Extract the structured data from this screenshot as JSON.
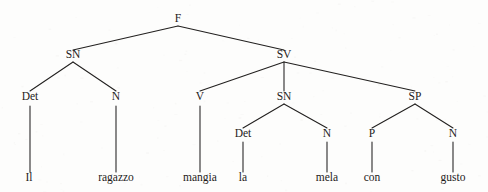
{
  "figure": {
    "kind": "constituency-syntax-tree",
    "sentence": "Il ragazzo mangia la mela con gusto",
    "language_note": "Italian",
    "background_color": "#fdfdfc",
    "ink_color": "#22201f"
  },
  "chart_data": {
    "type": "diagram",
    "title": "",
    "nodes": [
      {
        "id": "F",
        "label": "F",
        "x": 178,
        "y": 22,
        "level": 0,
        "kind": "nonterminal"
      },
      {
        "id": "SN1",
        "label": "SN",
        "x": 73,
        "y": 58,
        "level": 1,
        "kind": "nonterminal"
      },
      {
        "id": "SV",
        "label": "SV",
        "x": 284,
        "y": 58,
        "level": 1,
        "kind": "nonterminal"
      },
      {
        "id": "Det1",
        "label": "Det",
        "x": 30,
        "y": 100,
        "level": 2,
        "kind": "nonterminal"
      },
      {
        "id": "N1",
        "label": "N",
        "x": 116,
        "y": 100,
        "level": 2,
        "kind": "nonterminal"
      },
      {
        "id": "V",
        "label": "V",
        "x": 200,
        "y": 100,
        "level": 2,
        "kind": "nonterminal"
      },
      {
        "id": "SN2",
        "label": "SN",
        "x": 284,
        "y": 100,
        "level": 2,
        "kind": "nonterminal"
      },
      {
        "id": "SP",
        "label": "SP",
        "x": 415,
        "y": 100,
        "level": 2,
        "kind": "nonterminal"
      },
      {
        "id": "Det2",
        "label": "Det",
        "x": 243,
        "y": 137,
        "level": 3,
        "kind": "nonterminal"
      },
      {
        "id": "N2",
        "label": "N",
        "x": 327,
        "y": 137,
        "level": 3,
        "kind": "nonterminal"
      },
      {
        "id": "P",
        "label": "P",
        "x": 372,
        "y": 137,
        "level": 3,
        "kind": "nonterminal"
      },
      {
        "id": "N3",
        "label": "N",
        "x": 453,
        "y": 137,
        "level": 3,
        "kind": "nonterminal"
      },
      {
        "id": "w_il",
        "label": "Il",
        "x": 29,
        "y": 181,
        "level": 4,
        "kind": "terminal"
      },
      {
        "id": "w_rag",
        "label": "ragazzo",
        "x": 116,
        "y": 181,
        "level": 4,
        "kind": "terminal"
      },
      {
        "id": "w_man",
        "label": "mangia",
        "x": 200,
        "y": 181,
        "level": 4,
        "kind": "terminal"
      },
      {
        "id": "w_la",
        "label": "la",
        "x": 243,
        "y": 181,
        "level": 4,
        "kind": "terminal"
      },
      {
        "id": "w_mel",
        "label": "mela",
        "x": 327,
        "y": 181,
        "level": 4,
        "kind": "terminal"
      },
      {
        "id": "w_con",
        "label": "con",
        "x": 372,
        "y": 181,
        "level": 4,
        "kind": "terminal"
      },
      {
        "id": "w_gus",
        "label": "gusto",
        "x": 453,
        "y": 181,
        "level": 4,
        "kind": "terminal"
      }
    ],
    "edges": [
      {
        "from": "F",
        "to": "SN1",
        "x1": 178,
        "y1": 26,
        "x2": 73,
        "y2": 50,
        "style": "diagonal"
      },
      {
        "from": "F",
        "to": "SV",
        "x1": 178,
        "y1": 26,
        "x2": 284,
        "y2": 50,
        "style": "diagonal"
      },
      {
        "from": "SN1",
        "to": "Det1",
        "x1": 73,
        "y1": 62,
        "x2": 30,
        "y2": 91,
        "style": "diagonal"
      },
      {
        "from": "SN1",
        "to": "N1",
        "x1": 73,
        "y1": 62,
        "x2": 116,
        "y2": 91,
        "style": "diagonal"
      },
      {
        "from": "SV",
        "to": "V",
        "x1": 284,
        "y1": 62,
        "x2": 200,
        "y2": 91,
        "style": "diagonal"
      },
      {
        "from": "SV",
        "to": "SN2",
        "x1": 284,
        "y1": 62,
        "x2": 284,
        "y2": 91,
        "style": "vertical"
      },
      {
        "from": "SV",
        "to": "SP",
        "x1": 284,
        "y1": 62,
        "x2": 415,
        "y2": 91,
        "style": "diagonal"
      },
      {
        "from": "SN2",
        "to": "Det2",
        "x1": 284,
        "y1": 104,
        "x2": 243,
        "y2": 128,
        "style": "diagonal"
      },
      {
        "from": "SN2",
        "to": "N2",
        "x1": 284,
        "y1": 104,
        "x2": 327,
        "y2": 128,
        "style": "diagonal"
      },
      {
        "from": "SP",
        "to": "P",
        "x1": 415,
        "y1": 104,
        "x2": 372,
        "y2": 128,
        "style": "diagonal"
      },
      {
        "from": "SP",
        "to": "N3",
        "x1": 415,
        "y1": 104,
        "x2": 453,
        "y2": 128,
        "style": "diagonal"
      },
      {
        "from": "Det1",
        "to": "w_il",
        "x1": 30,
        "y1": 106,
        "x2": 30,
        "y2": 172,
        "style": "vertical"
      },
      {
        "from": "N1",
        "to": "w_rag",
        "x1": 116,
        "y1": 106,
        "x2": 116,
        "y2": 172,
        "style": "vertical"
      },
      {
        "from": "V",
        "to": "w_man",
        "x1": 200,
        "y1": 106,
        "x2": 200,
        "y2": 172,
        "style": "vertical"
      },
      {
        "from": "Det2",
        "to": "w_la",
        "x1": 243,
        "y1": 142,
        "x2": 243,
        "y2": 172,
        "style": "vertical"
      },
      {
        "from": "N2",
        "to": "w_mel",
        "x1": 327,
        "y1": 142,
        "x2": 327,
        "y2": 172,
        "style": "vertical"
      },
      {
        "from": "P",
        "to": "w_con",
        "x1": 372,
        "y1": 142,
        "x2": 372,
        "y2": 172,
        "style": "vertical"
      },
      {
        "from": "N3",
        "to": "w_gus",
        "x1": 453,
        "y1": 142,
        "x2": 453,
        "y2": 172,
        "style": "vertical"
      }
    ]
  }
}
